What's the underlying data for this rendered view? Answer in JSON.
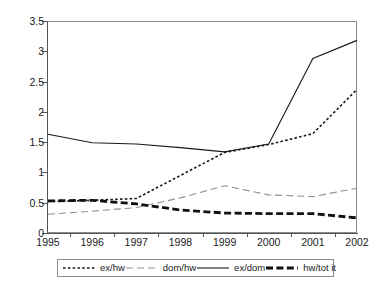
{
  "chart_data": {
    "type": "line",
    "title": "",
    "xlabel": "",
    "ylabel": "",
    "categories": [
      "1995",
      "1996",
      "1997",
      "1998",
      "1999",
      "2000",
      "2001",
      "2002"
    ],
    "x": [
      1995,
      1996,
      1997,
      1998,
      1999,
      2000,
      2001,
      2002
    ],
    "ylim": [
      0,
      3.5
    ],
    "yticks": [
      0,
      0.5,
      1,
      1.5,
      2,
      2.5,
      3,
      3.5
    ],
    "ytick_labels": [
      "0",
      "0.5",
      "1",
      "1.5",
      "2",
      "2.5",
      "3",
      "3.5"
    ],
    "grid": false,
    "legend_position": "bottom",
    "series": [
      {
        "name": "ex/hw",
        "style": "fine-dashed",
        "color": "#1a1a1a",
        "values": [
          0.52,
          0.54,
          0.57,
          0.95,
          1.33,
          1.46,
          1.64,
          2.37
        ]
      },
      {
        "name": "dom/hw",
        "style": "long-dashed-light",
        "color": "#8f8f8f",
        "values": [
          0.31,
          0.36,
          0.42,
          0.58,
          0.78,
          0.63,
          0.6,
          0.74
        ]
      },
      {
        "name": "ex/dom",
        "style": "solid",
        "color": "#1a1a1a",
        "values": [
          1.63,
          1.49,
          1.47,
          1.41,
          1.34,
          1.47,
          2.88,
          3.18
        ]
      },
      {
        "name": "hw/tot it",
        "style": "thick-dashed",
        "color": "#111111",
        "values": [
          0.53,
          0.54,
          0.48,
          0.38,
          0.33,
          0.32,
          0.32,
          0.25
        ]
      }
    ]
  },
  "legend": {
    "items": [
      {
        "label": "ex/hw"
      },
      {
        "label": "dom/hw"
      },
      {
        "label": "ex/dom"
      },
      {
        "label": "hw/tot it"
      }
    ]
  }
}
